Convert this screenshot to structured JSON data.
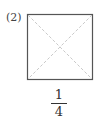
{
  "problem_label": "(2)",
  "figure": {
    "shape": "square",
    "diagonals": "dashed",
    "border_color": "#555555",
    "diagonal_color": "#bbbbbb"
  },
  "answer": {
    "numerator": "1",
    "denominator": "4"
  }
}
